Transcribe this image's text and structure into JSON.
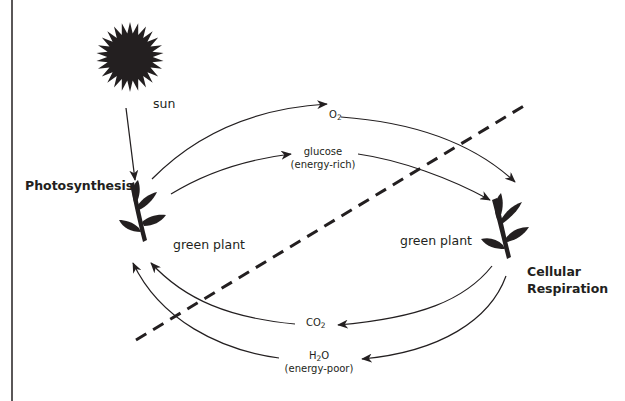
{
  "diagram": {
    "colors": {
      "ink": "#231f20",
      "background": "#ffffff"
    },
    "nodes": {
      "sun": {
        "label": "sun",
        "icon": "sun-icon"
      },
      "left_process": {
        "label": "Photosynthesis"
      },
      "left_plant": {
        "label": "green plant",
        "icon": "plant-icon"
      },
      "right_process": {
        "line1": "Cellular",
        "line2": "Respiration"
      },
      "right_plant": {
        "label": "green plant",
        "icon": "plant-icon"
      }
    },
    "flows": {
      "o2": {
        "base": "O",
        "sub": "2",
        "direction": "photosynthesis-to-respiration"
      },
      "glucose": {
        "line1": "glucose",
        "line2": "(energy-rich)",
        "direction": "photosynthesis-to-respiration"
      },
      "co2": {
        "base": "CO",
        "sub": "2",
        "direction": "respiration-to-photosynthesis"
      },
      "h2o": {
        "pre": "H",
        "sub": "2",
        "post": "O",
        "line2": "(energy-poor)",
        "direction": "respiration-to-photosynthesis"
      }
    },
    "divider": {
      "style": "dashed"
    }
  }
}
